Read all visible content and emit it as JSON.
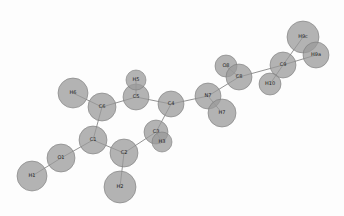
{
  "diagram": {
    "type": "molecular-structure",
    "colors": {
      "atom_fill": "#9a9a9a",
      "atom_stroke": "#7a7a7a",
      "bond": "#777777",
      "label": "#222222",
      "background": "#fdfdfd"
    },
    "atoms": [
      {
        "id": "H1",
        "x": 32,
        "y": 176,
        "r": 15
      },
      {
        "id": "O1",
        "x": 61,
        "y": 158,
        "r": 14
      },
      {
        "id": "C1",
        "x": 93,
        "y": 140,
        "r": 14
      },
      {
        "id": "C2",
        "x": 124,
        "y": 153,
        "r": 14
      },
      {
        "id": "H2",
        "x": 120,
        "y": 187,
        "r": 16
      },
      {
        "id": "C6",
        "x": 102,
        "y": 107,
        "r": 14
      },
      {
        "id": "H6",
        "x": 73,
        "y": 93,
        "r": 15
      },
      {
        "id": "C5",
        "x": 136,
        "y": 97,
        "r": 13
      },
      {
        "id": "H5",
        "x": 136,
        "y": 80,
        "r": 10
      },
      {
        "id": "C4",
        "x": 171,
        "y": 104,
        "r": 13
      },
      {
        "id": "C3",
        "x": 156,
        "y": 132,
        "r": 12
      },
      {
        "id": "H3",
        "x": 162,
        "y": 142,
        "r": 10
      },
      {
        "id": "N7",
        "x": 208,
        "y": 96,
        "r": 13
      },
      {
        "id": "H7",
        "x": 222,
        "y": 113,
        "r": 14
      },
      {
        "id": "O8",
        "x": 226,
        "y": 66,
        "r": 11
      },
      {
        "id": "C8",
        "x": 239,
        "y": 77,
        "r": 13
      },
      {
        "id": "C9",
        "x": 283,
        "y": 65,
        "r": 13
      },
      {
        "id": "H10",
        "x": 270,
        "y": 84,
        "r": 11
      },
      {
        "id": "H9c",
        "x": 303,
        "y": 37,
        "r": 16
      },
      {
        "id": "H9a",
        "x": 316,
        "y": 55,
        "r": 13
      }
    ],
    "bonds": [
      [
        "H1",
        "O1"
      ],
      [
        "O1",
        "C1"
      ],
      [
        "C1",
        "C2"
      ],
      [
        "C1",
        "C6"
      ],
      [
        "C2",
        "H2"
      ],
      [
        "C2",
        "C3"
      ],
      [
        "C6",
        "H6"
      ],
      [
        "C6",
        "C5"
      ],
      [
        "C5",
        "H5"
      ],
      [
        "C5",
        "C4"
      ],
      [
        "C4",
        "C3"
      ],
      [
        "C3",
        "H3"
      ],
      [
        "C4",
        "N7"
      ],
      [
        "N7",
        "H7"
      ],
      [
        "N7",
        "C8"
      ],
      [
        "C8",
        "O8"
      ],
      [
        "C8",
        "C9"
      ],
      [
        "C9",
        "H10"
      ],
      [
        "C9",
        "H9c"
      ],
      [
        "C9",
        "H9a"
      ]
    ]
  }
}
